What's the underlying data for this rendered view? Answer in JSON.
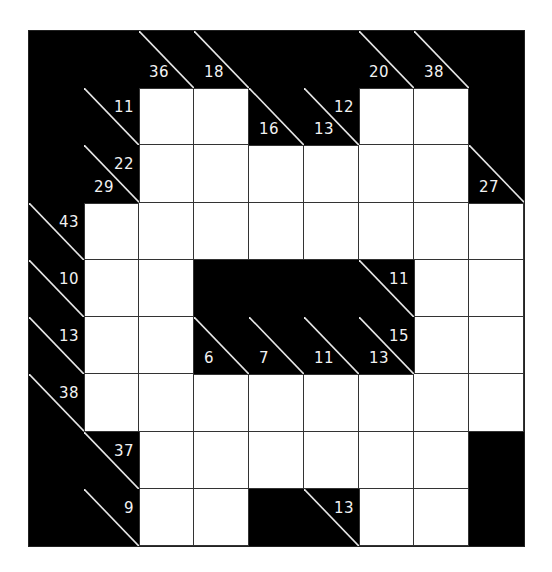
{
  "puzzle": {
    "type": "kakuro",
    "rows": 9,
    "cols": 9,
    "colors": {
      "block": "#000000",
      "cell": "#ffffff",
      "line": "#333333",
      "clue_text": "#f2f2f2"
    },
    "grid": [
      [
        {
          "t": "B"
        },
        {
          "t": "B"
        },
        {
          "t": "C",
          "down": "36"
        },
        {
          "t": "C",
          "down": "18"
        },
        {
          "t": "B"
        },
        {
          "t": "B"
        },
        {
          "t": "C",
          "down": "20"
        },
        {
          "t": "C",
          "down": "38"
        },
        {
          "t": "B"
        }
      ],
      [
        {
          "t": "B"
        },
        {
          "t": "C",
          "right": "11"
        },
        {
          "t": "W"
        },
        {
          "t": "W"
        },
        {
          "t": "C",
          "down": "16"
        },
        {
          "t": "C",
          "down": "13",
          "right": "12"
        },
        {
          "t": "W"
        },
        {
          "t": "W"
        },
        {
          "t": "B"
        }
      ],
      [
        {
          "t": "B"
        },
        {
          "t": "C",
          "down": "29",
          "right": "22"
        },
        {
          "t": "W"
        },
        {
          "t": "W"
        },
        {
          "t": "W"
        },
        {
          "t": "W"
        },
        {
          "t": "W"
        },
        {
          "t": "W"
        },
        {
          "t": "C",
          "down": "27"
        }
      ],
      [
        {
          "t": "C",
          "right": "43"
        },
        {
          "t": "W"
        },
        {
          "t": "W"
        },
        {
          "t": "W"
        },
        {
          "t": "W"
        },
        {
          "t": "W"
        },
        {
          "t": "W"
        },
        {
          "t": "W"
        },
        {
          "t": "W"
        }
      ],
      [
        {
          "t": "C",
          "right": "10"
        },
        {
          "t": "W"
        },
        {
          "t": "W"
        },
        {
          "t": "B"
        },
        {
          "t": "B"
        },
        {
          "t": "B"
        },
        {
          "t": "C",
          "right": "11"
        },
        {
          "t": "W"
        },
        {
          "t": "W"
        }
      ],
      [
        {
          "t": "C",
          "right": "13"
        },
        {
          "t": "W"
        },
        {
          "t": "W"
        },
        {
          "t": "C",
          "down": "6"
        },
        {
          "t": "C",
          "down": "7"
        },
        {
          "t": "C",
          "down": "11"
        },
        {
          "t": "C",
          "down": "13",
          "right": "15"
        },
        {
          "t": "W"
        },
        {
          "t": "W"
        }
      ],
      [
        {
          "t": "C",
          "right": "38"
        },
        {
          "t": "W"
        },
        {
          "t": "W"
        },
        {
          "t": "W"
        },
        {
          "t": "W"
        },
        {
          "t": "W"
        },
        {
          "t": "W"
        },
        {
          "t": "W"
        },
        {
          "t": "W"
        }
      ],
      [
        {
          "t": "B"
        },
        {
          "t": "C",
          "right": "37"
        },
        {
          "t": "W"
        },
        {
          "t": "W"
        },
        {
          "t": "W"
        },
        {
          "t": "W"
        },
        {
          "t": "W"
        },
        {
          "t": "W"
        },
        {
          "t": "B"
        }
      ],
      [
        {
          "t": "B"
        },
        {
          "t": "C",
          "right": "9"
        },
        {
          "t": "W"
        },
        {
          "t": "W"
        },
        {
          "t": "B"
        },
        {
          "t": "C",
          "right": "13"
        },
        {
          "t": "W"
        },
        {
          "t": "W"
        },
        {
          "t": "B"
        }
      ]
    ]
  }
}
